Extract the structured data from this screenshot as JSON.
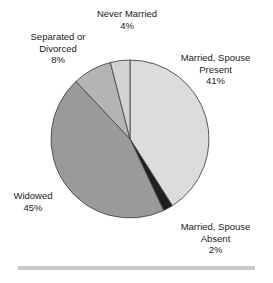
{
  "chart_data": {
    "type": "pie",
    "title": "",
    "subtitle": "",
    "xlabel": "",
    "ylabel": "",
    "legend_position": "none",
    "grid": false,
    "start_angle_deg": 0,
    "direction": "clockwise",
    "categories": [
      "Married, Spouse Present",
      "Married, Spouse Absent",
      "Widowed",
      "Separated or Divorced",
      "Never Married"
    ],
    "values": [
      41,
      2,
      45,
      8,
      4
    ],
    "value_labels": [
      "41%",
      "2%",
      "45%",
      "8%",
      "4%"
    ],
    "colors": [
      "#dcdcdc",
      "#1f1f1f",
      "#9a9a9a",
      "#b4b4b4",
      "#d2d2d2"
    ],
    "slice_border_color": "#4a4a4a",
    "annotations": [
      {
        "text": "Married, Spouse Present",
        "value": "41%"
      },
      {
        "text": "Married, Spouse Absent",
        "value": "2%"
      },
      {
        "text": "Widowed",
        "value": "45%"
      },
      {
        "text": "Separated or Divorced",
        "value": "8%"
      },
      {
        "text": "Never Married",
        "value": "4%"
      }
    ]
  },
  "labels": {
    "never_married": {
      "line1": "Never Married",
      "pct": "4%"
    },
    "separated_divorced": {
      "line1": "Separated or",
      "line2": "Divorced",
      "pct": "8%"
    },
    "married_present": {
      "line1": "Married, Spouse",
      "line2": "Present",
      "pct": "41%"
    },
    "married_absent": {
      "line1": "Married, Spouse",
      "line2": "Absent",
      "pct": "2%"
    },
    "widowed": {
      "line1": "Widowed",
      "pct": "45%"
    }
  }
}
